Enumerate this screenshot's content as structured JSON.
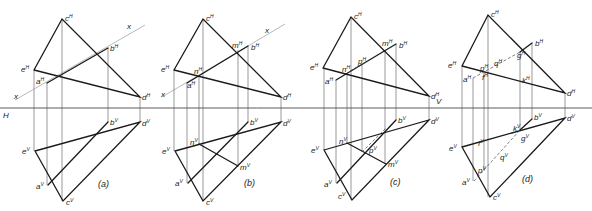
{
  "figure": {
    "ground_line_label_left": "H",
    "ground_line_label_right": "V",
    "cutting_plane_label": "x",
    "panels": [
      {
        "caption": "(a)",
        "labels_H": [
          "c",
          "e",
          "a",
          "b",
          "d"
        ],
        "labels_V": [
          "b",
          "d",
          "e",
          "a",
          "c"
        ],
        "sup_H": "H",
        "sup_V": "V"
      },
      {
        "caption": "(b)",
        "labels_H": [
          "c",
          "e",
          "n",
          "a",
          "m",
          "b",
          "d"
        ],
        "labels_V": [
          "b",
          "d",
          "n",
          "e",
          "m",
          "a",
          "c"
        ],
        "sup_H": "H",
        "sup_V": "V"
      },
      {
        "caption": "(c)",
        "labels_H": [
          "c",
          "e",
          "n",
          "p",
          "a",
          "m",
          "b",
          "d"
        ],
        "labels_V": [
          "b",
          "d",
          "n",
          "e",
          "p",
          "m",
          "a",
          "c"
        ],
        "sup_H": "H",
        "sup_V": "V"
      },
      {
        "caption": "(d)",
        "labels_H": [
          "c",
          "e",
          "p",
          "q",
          "f",
          "a",
          "g",
          "b",
          "k",
          "d"
        ],
        "labels_V": [
          "b",
          "d",
          "k",
          "g",
          "f",
          "e",
          "q",
          "p",
          "a",
          "c"
        ],
        "sup_H": "H",
        "sup_V": "V"
      }
    ]
  },
  "colors": {
    "line": "#1a1a1a",
    "projector": "#555555",
    "background": "#ffffff"
  }
}
